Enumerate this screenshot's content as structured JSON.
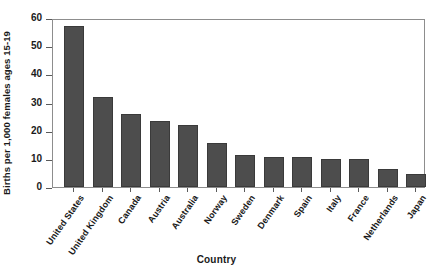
{
  "chart_data": {
    "type": "bar",
    "title": "",
    "xlabel": "Country",
    "ylabel": "Births per 1,000 females ages 15-19",
    "ylim": [
      0,
      60
    ],
    "yticks": [
      0,
      10,
      20,
      30,
      40,
      50,
      60
    ],
    "grid": false,
    "legend": null,
    "bar_color": "#4d4d4d",
    "categories": [
      "United States",
      "United Kingdom",
      "Canada",
      "Austria",
      "Australia",
      "Norway",
      "Sweden",
      "Denmark",
      "Spain",
      "Italy",
      "France",
      "Netherlands",
      "Japan"
    ],
    "values": [
      57,
      32,
      26,
      23.5,
      22,
      15.5,
      11.5,
      10.5,
      10.5,
      10,
      10,
      6.5,
      4.5
    ]
  }
}
